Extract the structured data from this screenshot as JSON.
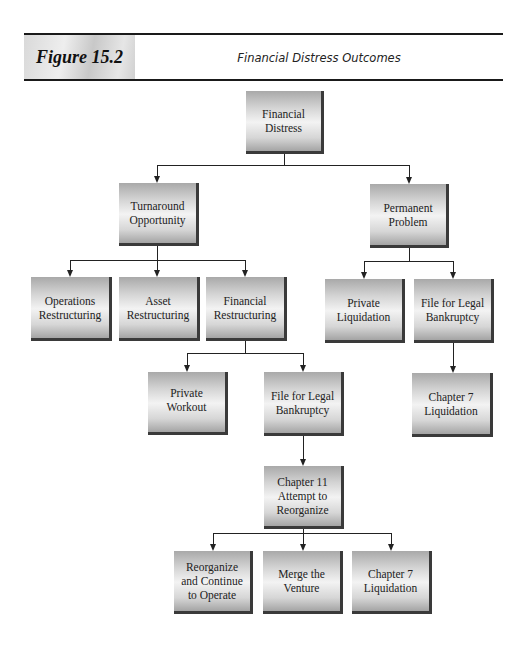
{
  "header": {
    "figure_label": "Figure 15.2",
    "figure_title": "Financial Distress Outcomes"
  },
  "nodes": {
    "financial_distress": "Financial Distress",
    "turnaround_opportunity": "Turnaround Opportunity",
    "permanent_problem": "Permanent Problem",
    "operations_restructuring": "Operations Restructuring",
    "asset_restructuring": "Asset Restructuring",
    "financial_restructuring": "Financial Restructuring",
    "private_liquidation": "Private Liquidation",
    "file_legal_bankruptcy_right": "File for Legal Bankruptcy",
    "private_workout": "Private Workout",
    "file_legal_bankruptcy_mid": "File for Legal Bankruptcy",
    "chapter7_liquidation_right": "Chapter 7 Liquidation",
    "chapter11_reorganize": "Chapter 11 Attempt to Reorganize",
    "reorganize_continue": "Reorganize and Continue to Operate",
    "merge_venture": "Merge the Venture",
    "chapter7_liquidation_bottom": "Chapter 7 Liquidation"
  },
  "edges": [
    [
      "Financial Distress",
      "Turnaround Opportunity"
    ],
    [
      "Financial Distress",
      "Permanent Problem"
    ],
    [
      "Turnaround Opportunity",
      "Operations Restructuring"
    ],
    [
      "Turnaround Opportunity",
      "Asset Restructuring"
    ],
    [
      "Turnaround Opportunity",
      "Financial Restructuring"
    ],
    [
      "Permanent Problem",
      "Private Liquidation"
    ],
    [
      "Permanent Problem",
      "File for Legal Bankruptcy"
    ],
    [
      "File for Legal Bankruptcy (right)",
      "Chapter 7 Liquidation"
    ],
    [
      "Financial Restructuring",
      "Private Workout"
    ],
    [
      "Financial Restructuring",
      "File for Legal Bankruptcy"
    ],
    [
      "File for Legal Bankruptcy (mid)",
      "Chapter 11 Attempt to Reorganize"
    ],
    [
      "Chapter 11 Attempt to Reorganize",
      "Reorganize and Continue to Operate"
    ],
    [
      "Chapter 11 Attempt to Reorganize",
      "Merge the Venture"
    ],
    [
      "Chapter 11 Attempt to Reorganize",
      "Chapter 7 Liquidation"
    ]
  ]
}
